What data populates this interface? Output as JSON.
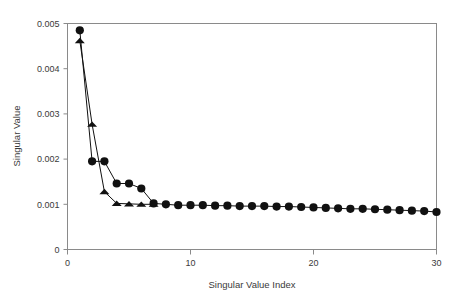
{
  "chart_data": {
    "type": "line",
    "title": "",
    "xlabel": "Singular Value Index",
    "ylabel": "Singular Value",
    "xlim": [
      0,
      30
    ],
    "ylim": [
      0,
      0.005
    ],
    "grid": false,
    "legend": "none",
    "xticks": [
      0,
      10,
      20,
      30
    ],
    "xtick_labels": [
      "0",
      "10",
      "20",
      "30"
    ],
    "yticks": [
      0,
      0.001,
      0.002,
      0.003,
      0.004,
      0.005
    ],
    "ytick_labels": [
      "0",
      "0.001",
      "0.002",
      "0.003",
      "0.004",
      "0.005"
    ],
    "marker_color": "#111111",
    "line_color": "#111111",
    "frame_color": "#8a8a8a",
    "series": [
      {
        "name": "circle-series",
        "marker": "circle",
        "x": [
          1,
          2,
          3,
          4,
          5,
          6,
          7,
          8,
          9,
          10,
          11,
          12,
          13,
          14,
          15,
          16,
          17,
          18,
          19,
          20,
          21,
          22,
          23,
          24,
          25,
          26,
          27,
          28,
          29,
          30
        ],
        "values": [
          0.00485,
          0.00195,
          0.00195,
          0.00146,
          0.00146,
          0.00135,
          0.00102,
          0.001,
          0.00098,
          0.00098,
          0.00098,
          0.00097,
          0.00097,
          0.00096,
          0.00096,
          0.00096,
          0.00095,
          0.00095,
          0.00094,
          0.00093,
          0.00092,
          0.00091,
          0.0009,
          0.0009,
          0.00089,
          0.00088,
          0.00087,
          0.00086,
          0.00085,
          0.00083
        ]
      },
      {
        "name": "triangle-series",
        "marker": "triangle",
        "x": [
          1,
          2,
          3,
          4,
          5,
          6,
          7
        ],
        "values": [
          0.00462,
          0.00277,
          0.00128,
          0.00102,
          0.00101,
          0.001,
          0.001
        ]
      }
    ]
  }
}
